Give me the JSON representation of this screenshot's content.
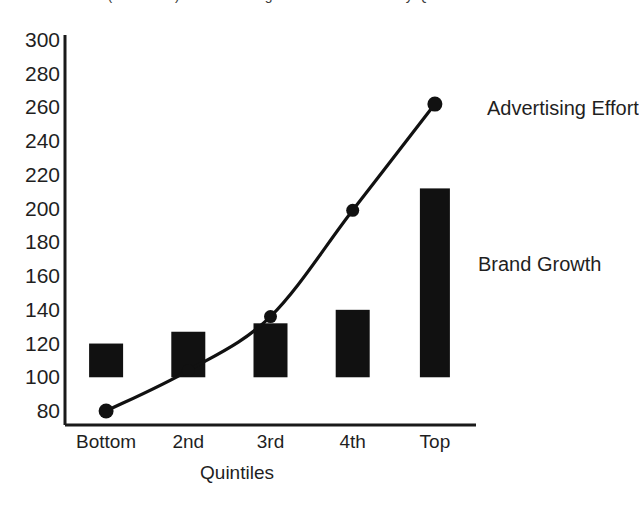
{
  "top_clipped_caption": "Exhibit (continued) — Advertising and Brand Growth by Quintile",
  "chart_data": {
    "type": "bar",
    "title": "",
    "subtitle": "",
    "xlabel": "Quintiles",
    "ylabel": "",
    "categories": [
      "Bottom",
      "2nd",
      "3rd",
      "4th",
      "Top"
    ],
    "ylim": [
      80,
      300
    ],
    "ytick_step": 20,
    "yticks": [
      80,
      100,
      120,
      140,
      160,
      180,
      200,
      220,
      240,
      260,
      280,
      300
    ],
    "grid": false,
    "legend_position": "inline-annotations",
    "bar_baseline": 100,
    "series": [
      {
        "name": "Brand Growth",
        "type": "bar",
        "color": "#111111",
        "values": [
          120,
          127,
          132,
          140,
          212
        ]
      },
      {
        "name": "Advertising Effort",
        "type": "line",
        "color": "#111111",
        "marker": "circle",
        "values": [
          80,
          104,
          136,
          199,
          262
        ]
      }
    ],
    "annotations": [
      {
        "text": "Advertising Effort",
        "anchor_category": "Top",
        "anchor_value": 262
      },
      {
        "text": "Brand Growth",
        "anchor_category": "Top",
        "anchor_value": 170
      }
    ]
  },
  "axis": {
    "x_label": "Quintiles",
    "tick_labels": [
      "Bottom",
      "2nd",
      "3rd",
      "4th",
      "Top"
    ]
  }
}
